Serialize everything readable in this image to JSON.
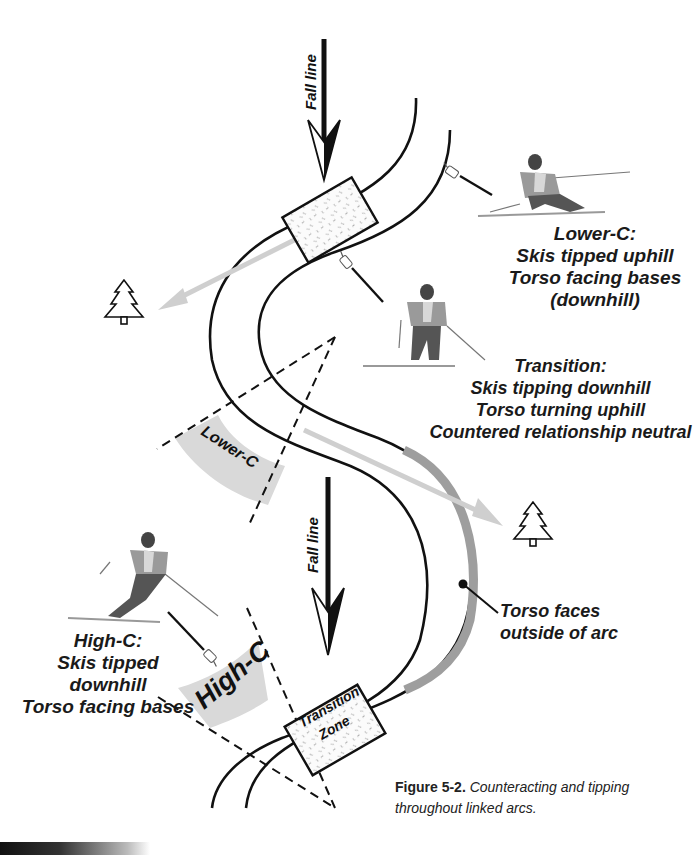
{
  "figure": {
    "fall_line_top": "Fall line",
    "fall_line_mid": "Fall line",
    "lower_c_band": "Lower-C",
    "high_c_band": "High-C",
    "transition_zone_line1": "Transition",
    "transition_zone_line2": "Zone",
    "lower_c_note": {
      "title": "Lower-C:",
      "line1": "Skis tipped uphill",
      "line2": "Torso facing bases",
      "line3": "(downhill)"
    },
    "transition_note": {
      "title": "Transition:",
      "line1": "Skis tipping downhill",
      "line2": "Torso turning uphill",
      "line3": "Countered relationship neutral"
    },
    "high_c_note": {
      "title": "High-C:",
      "line1": "Skis tipped downhill",
      "line2": "Torso facing bases"
    },
    "torso_note": {
      "line1": "Torso faces",
      "line2": "outside of arc"
    },
    "caption": {
      "label": "Figure 5-2.",
      "text_line1": "Counteracting and tipping",
      "text_line2": "throughout linked arcs."
    },
    "icons": [
      "tree-icon",
      "tree-icon",
      "pointing-hand-icon",
      "skier-illustration"
    ],
    "colors": {
      "line": "#111111",
      "band_fill": "#d9d9d9",
      "arc_fill": "#9e9e9e",
      "direction_arrow": "#cfcfcf"
    }
  }
}
